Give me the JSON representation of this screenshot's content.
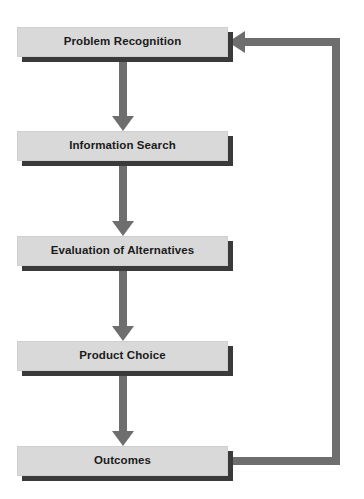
{
  "diagram": {
    "type": "flowchart",
    "orientation": "vertical",
    "colors": {
      "node_fill": "#d9d9d9",
      "node_border": "#cfcfcf",
      "node_shadow": "#3a3a3a",
      "connector": "#6e6e6e",
      "text": "#1b1b1b",
      "background": "#ffffff"
    },
    "nodes": [
      {
        "id": "problem-recognition",
        "label": "Problem Recognition",
        "x": 17,
        "y": 27
      },
      {
        "id": "information-search",
        "label": "Information Search",
        "x": 17,
        "y": 131
      },
      {
        "id": "evaluation-of-alternatives",
        "label": "Evaluation of Alternatives",
        "x": 17,
        "y": 236
      },
      {
        "id": "product-choice",
        "label": "Product Choice",
        "x": 17,
        "y": 341
      },
      {
        "id": "outcomes",
        "label": "Outcomes",
        "x": 17,
        "y": 446
      }
    ],
    "connectors": [
      {
        "id": "arrow-problem-to-search",
        "from": "problem-recognition",
        "to": "information-search",
        "kind": "straight-down",
        "arrowhead": "down"
      },
      {
        "id": "arrow-search-to-evaluation",
        "from": "information-search",
        "to": "evaluation-of-alternatives",
        "kind": "straight-down",
        "arrowhead": "down"
      },
      {
        "id": "arrow-evaluation-to-choice",
        "from": "evaluation-of-alternatives",
        "to": "product-choice",
        "kind": "straight-down",
        "arrowhead": "down"
      },
      {
        "id": "arrow-choice-to-outcomes",
        "from": "product-choice",
        "to": "outcomes",
        "kind": "straight-down",
        "arrowhead": "down"
      },
      {
        "id": "feedback-outcomes-to-problem",
        "from": "outcomes",
        "to": "problem-recognition",
        "kind": "right-loop-up",
        "arrowhead": "left"
      }
    ]
  }
}
